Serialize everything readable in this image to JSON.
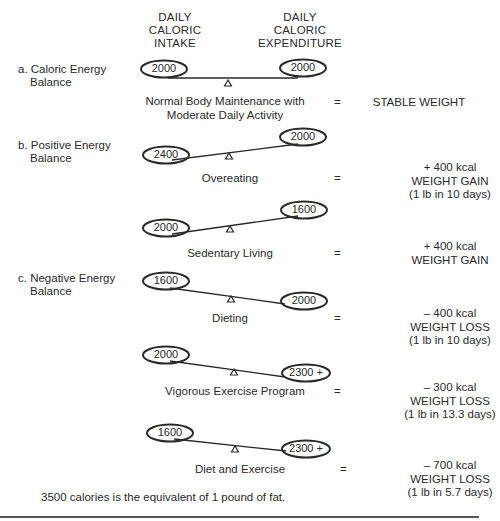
{
  "header": {
    "intake_label": [
      "DAILY",
      "CALORIC",
      "INTAKE"
    ],
    "expenditure_label": [
      "DAILY",
      "CALORIC",
      "EXPENDITURE"
    ]
  },
  "sections": [
    {
      "letter": "a.",
      "title_line1": "Caloric Energy",
      "title_line2": "Balance"
    },
    {
      "letter": "b.",
      "title_line1": "Positive Energy",
      "title_line2": "Balance"
    },
    {
      "letter": "c.",
      "title_line1": "Negative Energy",
      "title_line2": "Balance"
    }
  ],
  "scenarios": [
    {
      "section": "a",
      "intake": "2000",
      "expenditure": "2000",
      "caption_line1": "Normal Body Maintenance with",
      "caption_line2": "Moderate Daily Activity",
      "equals": "=",
      "result_line1": "STABLE WEIGHT",
      "result_line2": "",
      "result_line3": ""
    },
    {
      "section": "b",
      "intake": "2400",
      "expenditure": "2000",
      "caption_line1": "Overeating",
      "caption_line2": "",
      "equals": "=",
      "result_line1": "+ 400 kcal",
      "result_line2": "WEIGHT GAIN",
      "result_line3": "(1 lb in 10 days)"
    },
    {
      "section": "b",
      "intake": "2000",
      "expenditure": "1600",
      "caption_line1": "Sedentary Living",
      "caption_line2": "",
      "equals": "=",
      "result_line1": "+ 400 kcal",
      "result_line2": "WEIGHT GAIN",
      "result_line3": ""
    },
    {
      "section": "c",
      "intake": "1600",
      "expenditure": "2000",
      "caption_line1": "Dieting",
      "caption_line2": "",
      "equals": "=",
      "result_line1": "– 400 kcal",
      "result_line2": "WEIGHT LOSS",
      "result_line3": "(1 lb in 10 days)"
    },
    {
      "section": "c",
      "intake": "2000",
      "expenditure": "2300 +",
      "caption_line1": "Vigorous Exercise Program",
      "caption_line2": "",
      "equals": "=",
      "result_line1": "– 300 kcal",
      "result_line2": "WEIGHT LOSS",
      "result_line3": "(1 lb in 13.3 days)"
    },
    {
      "section": "c",
      "intake": "1600",
      "expenditure": "2300 +",
      "caption_line1": "Diet and Exercise",
      "caption_line2": "",
      "equals": "=",
      "result_line1": "– 700 kcal",
      "result_line2": "WEIGHT LOSS",
      "result_line3": "(1 lb in 5.7 days)"
    }
  ],
  "footnote": "3500 calories is the equivalent of 1 pound of fat.",
  "colors": {
    "ink": "#2a2a2a",
    "background": "#ffffff",
    "rule": "#555555"
  }
}
